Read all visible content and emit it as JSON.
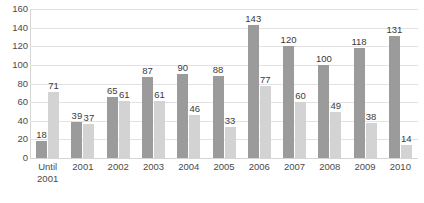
{
  "chart_data": {
    "type": "bar",
    "title": "",
    "subtitle": "",
    "xlabel": "",
    "ylabel": "",
    "ylim": [
      0,
      160
    ],
    "ytick_step": 20,
    "yticks": [
      160,
      140,
      120,
      100,
      80,
      60,
      40,
      20,
      0
    ],
    "grid": true,
    "legend": "none",
    "categories": [
      "Until\n2001",
      "2001",
      "2002",
      "2003",
      "2004",
      "2005",
      "2006",
      "2007",
      "2008",
      "2009",
      "2010"
    ],
    "series": [
      {
        "name": "Series 1",
        "color": "#9b9b9b",
        "values": [
          18,
          39,
          65,
          87,
          90,
          88,
          143,
          120,
          100,
          118,
          131
        ]
      },
      {
        "name": "Series 2",
        "color": "#d3d3d3",
        "values": [
          71,
          37,
          61,
          61,
          46,
          33,
          77,
          60,
          49,
          38,
          14
        ]
      }
    ],
    "data_labels": true
  },
  "colors": {
    "series1": "#9b9b9b",
    "series2": "#d3d3d3",
    "gridline": "#e2e2e2",
    "axis": "#d5d5d5",
    "text": "#3b3b3b",
    "background": "#ffffff"
  }
}
